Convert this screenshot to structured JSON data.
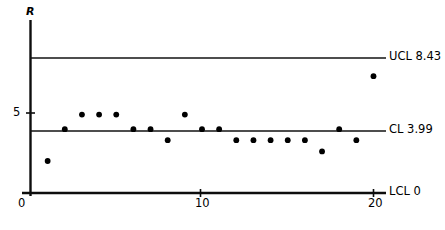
{
  "chart_data": {
    "type": "scatter",
    "title": "",
    "subtitle": "",
    "xlabel": "",
    "ylabel": "R",
    "xlim": [
      0,
      20.8
    ],
    "ylim": [
      0,
      9.6
    ],
    "grid": false,
    "legend": null,
    "x_ticks": [
      "0",
      "10",
      "20"
    ],
    "x_tick_values": [
      0,
      10,
      20
    ],
    "y_ticks": [
      "0",
      "5"
    ],
    "y_tick_values": [
      0,
      5
    ],
    "series": [
      {
        "name": "R",
        "x": [
          1,
          2,
          3,
          4,
          5,
          6,
          7,
          8,
          9,
          10,
          11,
          12,
          13,
          14,
          15,
          16,
          17,
          18,
          19,
          20
        ],
        "values": [
          2.0,
          3.99,
          4.9,
          4.9,
          4.9,
          3.99,
          3.99,
          3.3,
          4.9,
          3.99,
          3.99,
          3.3,
          3.3,
          3.3,
          3.3,
          3.3,
          2.6,
          3.99,
          3.3,
          7.3
        ]
      }
    ],
    "reference_lines": [
      {
        "id": "ucl",
        "label": "UCL 8.43",
        "value": 8.43
      },
      {
        "id": "cl",
        "label": "CL 3.99",
        "value": 3.99
      },
      {
        "id": "lcl",
        "label": "LCL 0",
        "value": 0
      }
    ],
    "colors": {
      "axis": "#0d0d0d",
      "limit_line": "#121212",
      "point": "#000000",
      "background": "#ffffff"
    }
  },
  "labels": {
    "y_axis_title": "R",
    "ucl": "UCL 8.43",
    "cl": "CL 3.99",
    "lcl": "LCL 0",
    "y_tick_5": "5",
    "y_tick_0": "0",
    "x_tick_0": "0",
    "x_tick_10": "10",
    "x_tick_20": "20"
  }
}
